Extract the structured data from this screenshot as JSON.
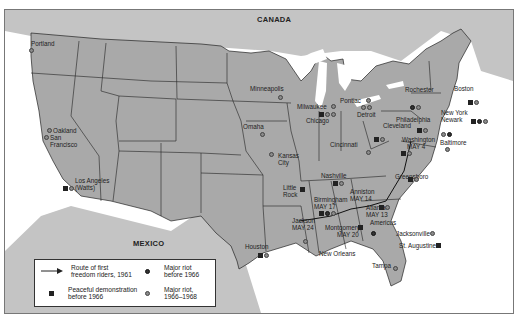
{
  "map": {
    "countries": [
      {
        "name": "CANADA",
        "x": 256,
        "y": 14
      },
      {
        "name": "MEXICO",
        "x": 132,
        "y": 238
      }
    ],
    "cities": [
      {
        "name": "Portland",
        "x": 43,
        "y": 42,
        "symbols": [
          "light"
        ]
      },
      {
        "name": "Oakland",
        "x": 52,
        "y": 128,
        "symbols": [
          "light"
        ]
      },
      {
        "name": "San Francisco",
        "x": 48,
        "y": 137,
        "symbols": [
          "light"
        ]
      },
      {
        "name": "Los Angeles (Watts)",
        "x": 72,
        "y": 178,
        "symbols": [
          "square",
          "light"
        ]
      },
      {
        "name": "Minneapolis",
        "x": 245,
        "y": 86,
        "symbols": [
          "light"
        ]
      },
      {
        "name": "Milwaukee",
        "x": 296,
        "y": 100,
        "symbols": [
          "light"
        ]
      },
      {
        "name": "Chicago",
        "x": 307,
        "y": 117,
        "symbols": [
          "square",
          "light",
          "light"
        ]
      },
      {
        "name": "Omaha",
        "x": 242,
        "y": 124,
        "symbols": [
          "light"
        ]
      },
      {
        "name": "Kansas City",
        "x": 277,
        "y": 153,
        "symbols": [
          "light"
        ]
      },
      {
        "name": "Pontiac",
        "x": 340,
        "y": 100,
        "symbols": [
          "light"
        ]
      },
      {
        "name": "Detroit",
        "x": 360,
        "y": 114,
        "symbols": [
          "light",
          "light"
        ]
      },
      {
        "name": "Cleveland",
        "x": 383,
        "y": 123,
        "symbols": [
          "square",
          "light"
        ]
      },
      {
        "name": "Cincinnati",
        "x": 344,
        "y": 142,
        "symbols": [
          "light"
        ]
      },
      {
        "name": "Rochester",
        "x": 406,
        "y": 89,
        "symbols": [
          "light",
          "light"
        ]
      },
      {
        "name": "Boston",
        "x": 454,
        "y": 88,
        "symbols": [
          "square",
          "light"
        ]
      },
      {
        "name": "New York",
        "x": 443,
        "y": 111,
        "symbols": [
          "square",
          "light",
          "light"
        ]
      },
      {
        "name": "Newark",
        "x": 437,
        "y": 118,
        "symbols": [
          "light",
          "light"
        ]
      },
      {
        "name": "Philadelphia",
        "x": 415,
        "y": 117,
        "symbols": [
          "square",
          "light"
        ]
      },
      {
        "name": "Baltimore",
        "x": 439,
        "y": 139,
        "symbols": [
          "light"
        ]
      },
      {
        "name": "Washington MAY 4",
        "x": 406,
        "y": 137,
        "symbols": [
          "square",
          "light"
        ]
      },
      {
        "name": "Nashville",
        "x": 322,
        "y": 174,
        "symbols": [
          "square",
          "light"
        ]
      },
      {
        "name": "Greensboro",
        "x": 397,
        "y": 176,
        "symbols": [
          "square",
          "light"
        ]
      },
      {
        "name": "Little Rock",
        "x": 278,
        "y": 198,
        "symbols": [
          "square"
        ]
      },
      {
        "name": "Anniston MAY 14",
        "x": 363,
        "y": 197,
        "symbols": []
      },
      {
        "name": "Birmingham MAY 17",
        "x": 318,
        "y": 204,
        "symbols": [
          "square",
          "dark",
          "light"
        ]
      },
      {
        "name": "Atlanta MAY 13",
        "x": 384,
        "y": 203,
        "symbols": [
          "square",
          "light"
        ]
      },
      {
        "name": "Americus",
        "x": 388,
        "y": 223,
        "symbols": [
          "dark"
        ]
      },
      {
        "name": "Jackson MAY 24",
        "x": 296,
        "y": 220,
        "symbols": [
          "light"
        ]
      },
      {
        "name": "Montgomery MAY 20",
        "x": 334,
        "y": 226,
        "symbols": [
          "square"
        ]
      },
      {
        "name": "Houston",
        "x": 251,
        "y": 250,
        "symbols": [
          "square",
          "light"
        ]
      },
      {
        "name": "New Orleans",
        "x": 322,
        "y": 250,
        "symbols": []
      },
      {
        "name": "Jacksonville",
        "x": 398,
        "y": 232,
        "symbols": [
          "light"
        ]
      },
      {
        "name": "St. Augustine",
        "x": 402,
        "y": 243,
        "symbols": [
          "square"
        ]
      },
      {
        "name": "Tampa",
        "x": 390,
        "y": 266,
        "symbols": [
          "light"
        ]
      }
    ],
    "labels": [
      {
        "id": "portland",
        "text": "Portland",
        "x": 30,
        "y": 40
      },
      {
        "id": "oakland",
        "text": "Oakland",
        "x": 52,
        "y": 127
      },
      {
        "id": "sanfran1",
        "text": "San",
        "x": 49,
        "y": 134
      },
      {
        "id": "sanfran2",
        "text": "Francisco",
        "x": 49,
        "y": 141
      },
      {
        "id": "la1",
        "text": "Los Angeles",
        "x": 74,
        "y": 177
      },
      {
        "id": "la2",
        "text": "(Watts)",
        "x": 74,
        "y": 184
      },
      {
        "id": "minneapolis",
        "text": "Minneapolis",
        "x": 249,
        "y": 85
      },
      {
        "id": "milwaukee",
        "text": "Milwaukee",
        "x": 296,
        "y": 103
      },
      {
        "id": "chicago",
        "text": "Chicago",
        "x": 305,
        "y": 117
      },
      {
        "id": "omaha",
        "text": "Omaha",
        "x": 242,
        "y": 123
      },
      {
        "id": "kc1",
        "text": "Kansas",
        "x": 277,
        "y": 152
      },
      {
        "id": "kc2",
        "text": "City",
        "x": 277,
        "y": 159
      },
      {
        "id": "pontiac",
        "text": "Pontiac",
        "x": 339,
        "y": 97
      },
      {
        "id": "detroit",
        "text": "Detroit",
        "x": 356,
        "y": 111
      },
      {
        "id": "cleveland",
        "text": "Cleveland",
        "x": 382,
        "y": 122
      },
      {
        "id": "cincinnati",
        "text": "Cincinnati",
        "x": 329,
        "y": 141
      },
      {
        "id": "rochester",
        "text": "Rochester",
        "x": 404,
        "y": 86
      },
      {
        "id": "boston",
        "text": "Boston",
        "x": 453,
        "y": 85
      },
      {
        "id": "newyork",
        "text": "New York",
        "x": 440,
        "y": 109
      },
      {
        "id": "newark",
        "text": "Newark",
        "x": 440,
        "y": 116
      },
      {
        "id": "philadelphia",
        "text": "Philadelphia",
        "x": 395,
        "y": 116
      },
      {
        "id": "baltimore",
        "text": "Baltimore",
        "x": 439,
        "y": 139
      },
      {
        "id": "wash1",
        "text": "Washington",
        "x": 401,
        "y": 136
      },
      {
        "id": "wash2",
        "text": "MAY 4",
        "x": 406,
        "y": 143
      },
      {
        "id": "nashville",
        "text": "Nashville",
        "x": 320,
        "y": 172
      },
      {
        "id": "greensboro",
        "text": "Greensboro",
        "x": 394,
        "y": 173
      },
      {
        "id": "lr1",
        "text": "Little",
        "x": 282,
        "y": 184
      },
      {
        "id": "lr2",
        "text": "Rock",
        "x": 282,
        "y": 191
      },
      {
        "id": "anniston1",
        "text": "Anniston",
        "x": 349,
        "y": 188
      },
      {
        "id": "anniston2",
        "text": "MAY 14",
        "x": 349,
        "y": 195
      },
      {
        "id": "birm1",
        "text": "Birmingham",
        "x": 313,
        "y": 196
      },
      {
        "id": "birm2",
        "text": "MAY 17",
        "x": 313,
        "y": 203
      },
      {
        "id": "atlanta1",
        "text": "Atlanta",
        "x": 365,
        "y": 204
      },
      {
        "id": "atlanta2",
        "text": "MAY 13",
        "x": 365,
        "y": 211
      },
      {
        "id": "americus",
        "text": "Americus",
        "x": 369,
        "y": 219
      },
      {
        "id": "jackson1",
        "text": "Jackson",
        "x": 291,
        "y": 217
      },
      {
        "id": "jackson2",
        "text": "MAY 24",
        "x": 291,
        "y": 224
      },
      {
        "id": "mont1",
        "text": "Montgomery",
        "x": 324,
        "y": 224
      },
      {
        "id": "mont2",
        "text": "MAY 20",
        "x": 336,
        "y": 231
      },
      {
        "id": "houston",
        "text": "Houston",
        "x": 244,
        "y": 243
      },
      {
        "id": "neworleans",
        "text": "New Orleans",
        "x": 318,
        "y": 250
      },
      {
        "id": "jacksonville",
        "text": "Jacksonville",
        "x": 395,
        "y": 230
      },
      {
        "id": "staugustine",
        "text": "St. Augustine",
        "x": 398,
        "y": 242
      },
      {
        "id": "tampa",
        "text": "Tampa",
        "x": 371,
        "y": 262
      }
    ]
  },
  "legend": {
    "route_label_1": "Route of first",
    "route_label_2": "freedom riders, 1961",
    "peaceful_label_1": "Peaceful demonstration",
    "peaceful_label_2": "before 1966",
    "riot_before_label_1": "Major riot",
    "riot_before_label_2": "before 1966",
    "riot_after_label_1": "Major riot,",
    "riot_after_label_2": "1966–1968"
  },
  "colors": {
    "land_us": "#a9a9a9",
    "land_foreign": "#c4c4c4",
    "water": "#ffffff",
    "border": "#222222"
  }
}
